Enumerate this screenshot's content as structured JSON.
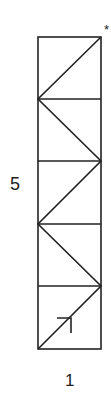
{
  "diagram": {
    "type": "zigzag-strip",
    "rows": 5,
    "cols": 1,
    "labels": {
      "height": "5",
      "width": "1",
      "marker": "*"
    },
    "frame": {
      "x0": 38,
      "x1": 101,
      "y0": 37,
      "y1": 349
    },
    "row_lines_y": [
      37,
      99,
      161,
      224,
      286,
      349
    ],
    "zigzag_points": [
      [
        101,
        37
      ],
      [
        38,
        99
      ],
      [
        101,
        161
      ],
      [
        38,
        224
      ],
      [
        101,
        286
      ],
      [
        38,
        349
      ]
    ],
    "arrow": {
      "at": [
        71,
        318
      ],
      "direction": "up-right"
    },
    "stroke_color": "#222222"
  }
}
